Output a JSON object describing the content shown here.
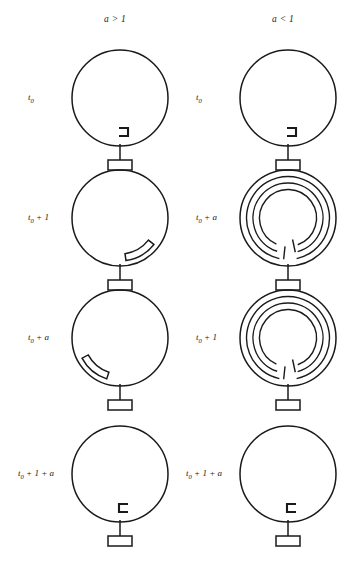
{
  "figure": {
    "title_present": false,
    "columns": [
      {
        "header": "a > 1",
        "header_x": 104,
        "header_y": 14
      },
      {
        "header": "a < 1",
        "header_x": 272,
        "header_y": 14
      }
    ],
    "stroke_color": "#1a1a1a",
    "background": "#ffffff"
  },
  "cells": [
    {
      "id": "left-r1",
      "column": "a > 1",
      "label": "t0 + 0",
      "label_main": "t",
      "label_sub": "0",
      "label_rest": "",
      "state": "bracket-right",
      "turns": 0,
      "cx": 120,
      "cy": 98,
      "r": 48,
      "label_x": 28,
      "label_y": 92
    },
    {
      "id": "right-r1",
      "column": "a < 1",
      "label": "t0 + 0",
      "label_main": "t",
      "label_sub": "0",
      "label_rest": "",
      "state": "bracket-right",
      "turns": 0,
      "cx": 288,
      "cy": 98,
      "r": 48,
      "label_x": 196,
      "label_y": 92
    },
    {
      "id": "left-r2",
      "column": "a > 1",
      "label": "t0 + 1",
      "label_main": "t",
      "label_sub": "0",
      "label_rest": " + 1",
      "state": "arc-lower-right",
      "turns": 0,
      "cx": 120,
      "cy": 218,
      "r": 48,
      "label_x": 28,
      "label_y": 212
    },
    {
      "id": "right-r2",
      "column": "a < 1",
      "label": "t0 + a",
      "label_main": "t",
      "label_sub": "0",
      "label_rest": " + a",
      "state": "spiral",
      "turns": 3,
      "cx": 288,
      "cy": 218,
      "r": 48,
      "label_x": 196,
      "label_y": 212
    },
    {
      "id": "left-r3",
      "column": "a > 1",
      "label": "t0 + a",
      "label_main": "t",
      "label_sub": "0",
      "label_rest": " + a",
      "state": "arc-lower-left",
      "turns": 0,
      "cx": 120,
      "cy": 338,
      "r": 48,
      "label_x": 28,
      "label_y": 332
    },
    {
      "id": "right-r3",
      "column": "a < 1",
      "label": "t0 + 1",
      "label_main": "t",
      "label_sub": "0",
      "label_rest": " + 1",
      "state": "spiral",
      "turns": 3,
      "cx": 288,
      "cy": 338,
      "r": 48,
      "label_x": 196,
      "label_y": 332
    },
    {
      "id": "left-r4",
      "column": "a > 1",
      "label": "t0 + 1 + a",
      "label_main": "t",
      "label_sub": "0",
      "label_rest": " + 1 + a",
      "state": "bracket-left",
      "turns": 0,
      "cx": 120,
      "cy": 474,
      "r": 48,
      "label_x": 18,
      "label_y": 468
    },
    {
      "id": "right-r4",
      "column": "a < 1",
      "label": "t0 + 1 + a",
      "label_main": "t",
      "label_sub": "0",
      "label_rest": " + 1 + a",
      "state": "bracket-left",
      "turns": 0,
      "cx": 288,
      "cy": 474,
      "r": 48,
      "label_x": 186,
      "label_y": 468
    }
  ],
  "glyphs": {
    "circle": "loop-circle",
    "stem": "stem-line",
    "base": "base-box",
    "bracket_right": "bracket-right-glyph",
    "bracket_left": "bracket-left-glyph",
    "thick_arc": "thick-arc-glyph",
    "spiral": "spiral-glyph"
  }
}
